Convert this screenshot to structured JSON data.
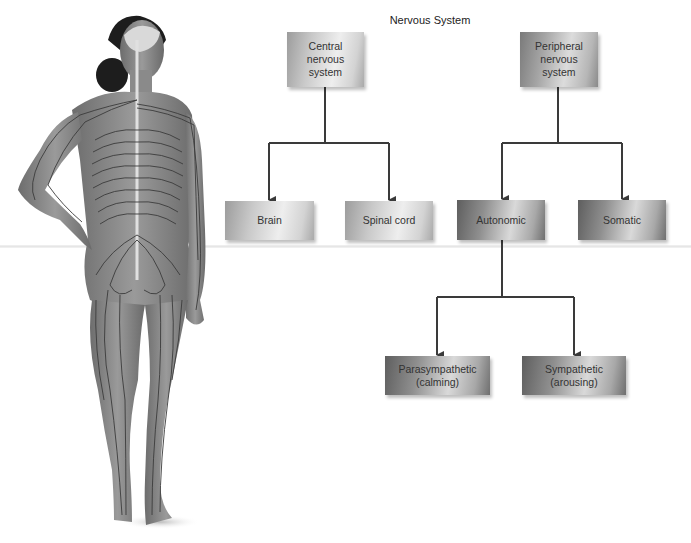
{
  "title": "Nervous System",
  "nodes": {
    "cns": {
      "label": "Central\nnervous\nsystem"
    },
    "pns": {
      "label": "Peripheral\nnervous\nsystem"
    },
    "brain": {
      "label": "Brain"
    },
    "spinal_cord": {
      "label": "Spinal cord"
    },
    "autonomic": {
      "label": "Autonomic"
    },
    "somatic": {
      "label": "Somatic"
    },
    "parasympathetic": {
      "label": "Parasympathetic\n(calming)"
    },
    "sympathetic": {
      "label": "Sympathetic\n(arousing)"
    }
  },
  "edges": [
    {
      "from": "cns",
      "to": "brain"
    },
    {
      "from": "cns",
      "to": "spinal_cord"
    },
    {
      "from": "pns",
      "to": "autonomic"
    },
    {
      "from": "pns",
      "to": "somatic"
    },
    {
      "from": "autonomic",
      "to": "parasympathetic"
    },
    {
      "from": "autonomic",
      "to": "sympathetic"
    }
  ],
  "illustration": {
    "subject": "human-figure-nervous-system-back-view"
  },
  "colors": {
    "line": "#3a3a3a",
    "box_light": "#d6d6d6",
    "box_dark": "#8f8f8f",
    "text": "#333333"
  }
}
